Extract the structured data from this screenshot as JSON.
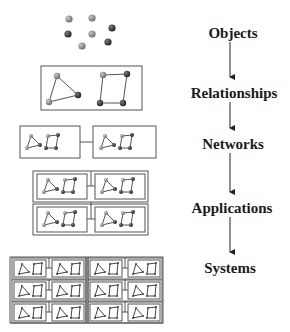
{
  "stages": [
    {
      "id": "objects",
      "label": "Objects",
      "x": 233,
      "y": 33
    },
    {
      "id": "relationships",
      "label": "Relationships",
      "x": 234,
      "y": 93
    },
    {
      "id": "networks",
      "label": "Networks",
      "x": 233,
      "y": 144
    },
    {
      "id": "applications",
      "label": "Applications",
      "x": 232,
      "y": 208
    },
    {
      "id": "systems",
      "label": "Systems",
      "x": 230,
      "y": 268
    }
  ],
  "arrows": [
    {
      "from": "objects",
      "to": "relationships",
      "x": 230,
      "y1": 42,
      "y2": 82
    },
    {
      "from": "relationships",
      "to": "networks",
      "x": 230,
      "y1": 102,
      "y2": 133
    },
    {
      "from": "networks",
      "to": "applications",
      "x": 230,
      "y1": 153,
      "y2": 197
    },
    {
      "from": "applications",
      "to": "systems",
      "x": 230,
      "y1": 217,
      "y2": 257
    }
  ],
  "objects": [
    {
      "x": 69,
      "y": 19,
      "shade": "mid"
    },
    {
      "x": 92,
      "y": 18,
      "shade": "mid"
    },
    {
      "x": 68,
      "y": 34,
      "shade": "dark"
    },
    {
      "x": 92,
      "y": 34,
      "shade": "mid"
    },
    {
      "x": 112,
      "y": 28,
      "shade": "dark"
    },
    {
      "x": 82,
      "y": 46,
      "shade": "mid"
    },
    {
      "x": 108,
      "y": 42,
      "shade": "dark"
    }
  ],
  "colors": {
    "node_mid": "#8a8a8a",
    "node_dark": "#3a3a3a",
    "stroke": "#555555",
    "text": "#1a1a1a",
    "background": "#ffffff"
  }
}
